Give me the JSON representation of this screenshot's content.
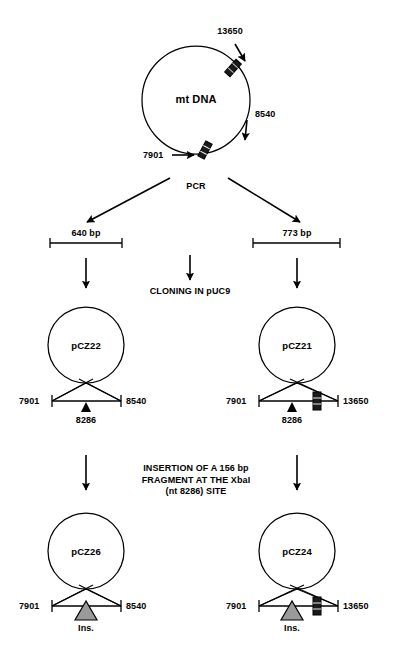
{
  "figure": {
    "colors": {
      "line": "#000000",
      "marker_fill": "#1a1a1a",
      "insert_fill": "#9a9a9a",
      "background": "#ffffff"
    }
  },
  "mtdna": {
    "label": "mt DNA",
    "positions": [
      {
        "name": "13650",
        "value": "13650"
      },
      {
        "name": "8540",
        "value": "8540"
      },
      {
        "name": "7901",
        "value": "7901"
      }
    ]
  },
  "steps": {
    "pcr": "PCR",
    "cloning": "CLONING IN pUC9",
    "insertion_line1": "INSERTION OF A 156 bp",
    "insertion_line2": "FRAGMENT AT THE XbaI",
    "insertion_line3": "(nt 8286) SITE"
  },
  "fragments": [
    {
      "name": "left-fragment",
      "label": "640 bp"
    },
    {
      "name": "right-fragment",
      "label": "773 bp"
    }
  ],
  "plasmids": [
    {
      "name": "pCZ22",
      "label": "pCZ22",
      "left_coord": "7901",
      "right_coord": "8540",
      "site_label": "8286",
      "has_site_arrow": true,
      "has_black_box": false,
      "has_insert": false
    },
    {
      "name": "pCZ21",
      "label": "pCZ21",
      "left_coord": "7901",
      "right_coord": "13650",
      "site_label": "8286",
      "has_site_arrow": true,
      "has_black_box": true,
      "has_insert": false
    },
    {
      "name": "pCZ26",
      "label": "pCZ26",
      "left_coord": "7901",
      "right_coord": "8540",
      "site_label": "Ins.",
      "has_site_arrow": false,
      "has_black_box": false,
      "has_insert": true
    },
    {
      "name": "pCZ24",
      "label": "pCZ24",
      "left_coord": "7901",
      "right_coord": "13650",
      "site_label": "Ins.",
      "has_site_arrow": false,
      "has_black_box": true,
      "has_insert": true
    }
  ]
}
